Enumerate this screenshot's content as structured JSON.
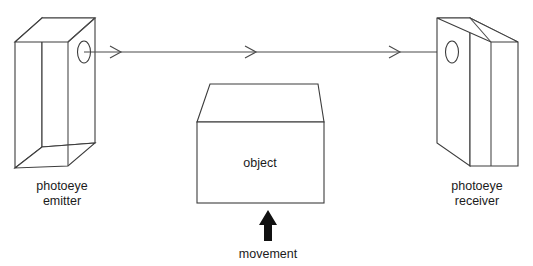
{
  "diagram": {
    "background_color": "#ffffff",
    "line_color": "#3c3c3c",
    "beam_color": "#4a4a4a",
    "text_color": "#1b1b1b",
    "arrow_fill": "#111111"
  },
  "emitter": {
    "label_line1": "photoeye",
    "label_line2": "emitter",
    "lens_name": "emitter-lens"
  },
  "receiver": {
    "label_line1": "photoeye",
    "label_line2": "receiver",
    "lens_name": "receiver-lens"
  },
  "object": {
    "label": "object"
  },
  "movement": {
    "label": "movement"
  },
  "beam": {
    "arrowhead_count": 3,
    "direction": "left-to-right"
  }
}
